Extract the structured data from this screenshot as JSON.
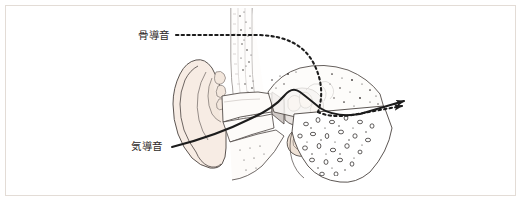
{
  "figure": {
    "title_visible": false,
    "background_color": "#ffffff",
    "border_color": "#e3dcd6"
  },
  "labels": [
    {
      "id": "bone-conduction",
      "text": "骨導音",
      "x": 138,
      "y": 39,
      "leader_style": "dotted",
      "leader_color": "#1c1c1c"
    },
    {
      "id": "air-conduction",
      "text": "気導音",
      "x": 131,
      "y": 150,
      "leader_style": "solid",
      "leader_color": "#1c1c1c"
    }
  ],
  "pathways": [
    {
      "id": "bone-conduction-path",
      "name": "骨導音",
      "style": "dotted",
      "color": "#1c1c1c",
      "arrowhead": true,
      "description": "skull-bone route to cochlea"
    },
    {
      "id": "air-conduction-path",
      "name": "気導音",
      "style": "solid",
      "color": "#1c1c1c",
      "arrowhead": true,
      "description": "ear-canal route through eardrum and ossicles to cochlea"
    }
  ],
  "anatomy": {
    "pinna_fill": "#f7ece4",
    "bone_fill": "#fdfbf9",
    "cartilage_fill": "#f3e7dd",
    "cochlea_fill": "#efe2d6",
    "tympanic_fill": "#cfc9c6",
    "outline_color": "#4a4340",
    "stipple_color": "#3a3533",
    "parts": [
      "pinna",
      "ear-canal",
      "tympanic-membrane",
      "ossicles",
      "cochlea",
      "mastoid-bone",
      "temporal-bone",
      "skull-outer-table"
    ]
  }
}
